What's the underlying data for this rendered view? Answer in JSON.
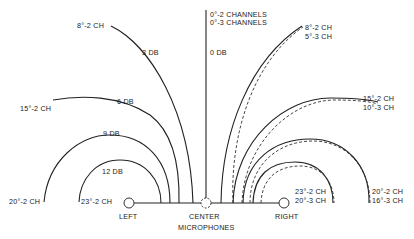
{
  "diagram": {
    "microphones": {
      "left": "LEFT",
      "center": "CENTER",
      "right": "RIGHT",
      "caption": "MICROPHONES"
    },
    "center_axis": {
      "label_2ch": "0°-2 CHANNELS",
      "label_3ch": "0°-3 CHANNELS",
      "db_label": "0 DB"
    },
    "left_curves": [
      {
        "angle_label": "8°-2 CH",
        "db_label": "3 DB"
      },
      {
        "angle_label": "15°-2 CH",
        "db_label": "6 DB"
      },
      {
        "angle_label": "20°-2 CH",
        "db_label": "9 DB"
      },
      {
        "angle_label": "23°-2 CH",
        "db_label": "12 DB"
      }
    ],
    "right_curves": [
      {
        "label_2ch": "8°-2 CH",
        "label_3ch": "5°-3 CH"
      },
      {
        "label_2ch": "15°-2 CH",
        "label_3ch": "10°-3 CH"
      },
      {
        "label_2ch": "20°-2 CH",
        "label_3ch": "16°-3 CH"
      },
      {
        "label_2ch": "23°-2 CH",
        "label_3ch": "20°-3 CH"
      }
    ],
    "legend": {
      "solid": "2 channels",
      "dashed": "3 channels"
    }
  }
}
